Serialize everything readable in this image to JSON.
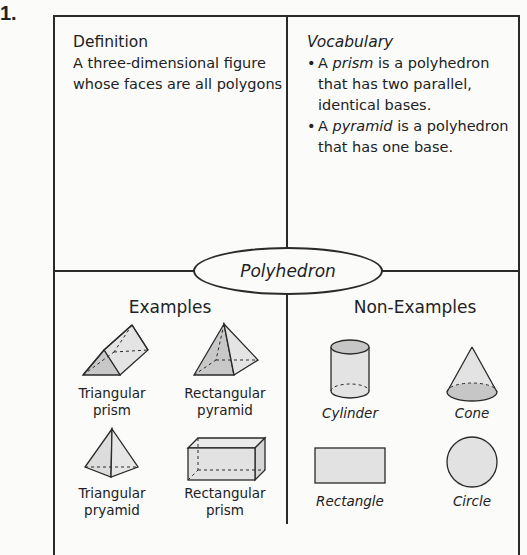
{
  "problem_number": "1.",
  "center_term": "Polyhedron",
  "definition": {
    "title": "Definition",
    "text": "A three-dimensional figure whose faces are all polygons"
  },
  "vocabulary": {
    "title": "Vocabulary",
    "items": [
      {
        "prefix": "A ",
        "term": "prism",
        "suffix": " is a polyhedron that has two parallel, identical bases."
      },
      {
        "prefix": "A ",
        "term": "pyramid",
        "suffix": " is a polyhedron that has one base."
      }
    ]
  },
  "examples": {
    "title": "Examples",
    "items": [
      {
        "line1": "Triangular",
        "line2": "prism",
        "icon": "triangular-prism-icon"
      },
      {
        "line1": "Rectangular",
        "line2": "pyramid",
        "icon": "rectangular-pyramid-icon"
      },
      {
        "line1": "Triangular",
        "line2": "pryamid",
        "icon": "triangular-pyramid-icon"
      },
      {
        "line1": "Rectangular",
        "line2": "prism",
        "icon": "rectangular-prism-icon"
      }
    ]
  },
  "non_examples": {
    "title": "Non-Examples",
    "items": [
      {
        "label": "Cylinder",
        "icon": "cylinder-icon"
      },
      {
        "label": "Cone",
        "icon": "cone-icon"
      },
      {
        "label": "Rectangle",
        "icon": "rectangle-icon"
      },
      {
        "label": "Circle",
        "icon": "circle-icon"
      }
    ]
  },
  "colors": {
    "line": "#2a2a2a",
    "shape_light": "#e2e2e2",
    "shape_dark": "#c4c4c4",
    "background": "#fbfbfa"
  }
}
